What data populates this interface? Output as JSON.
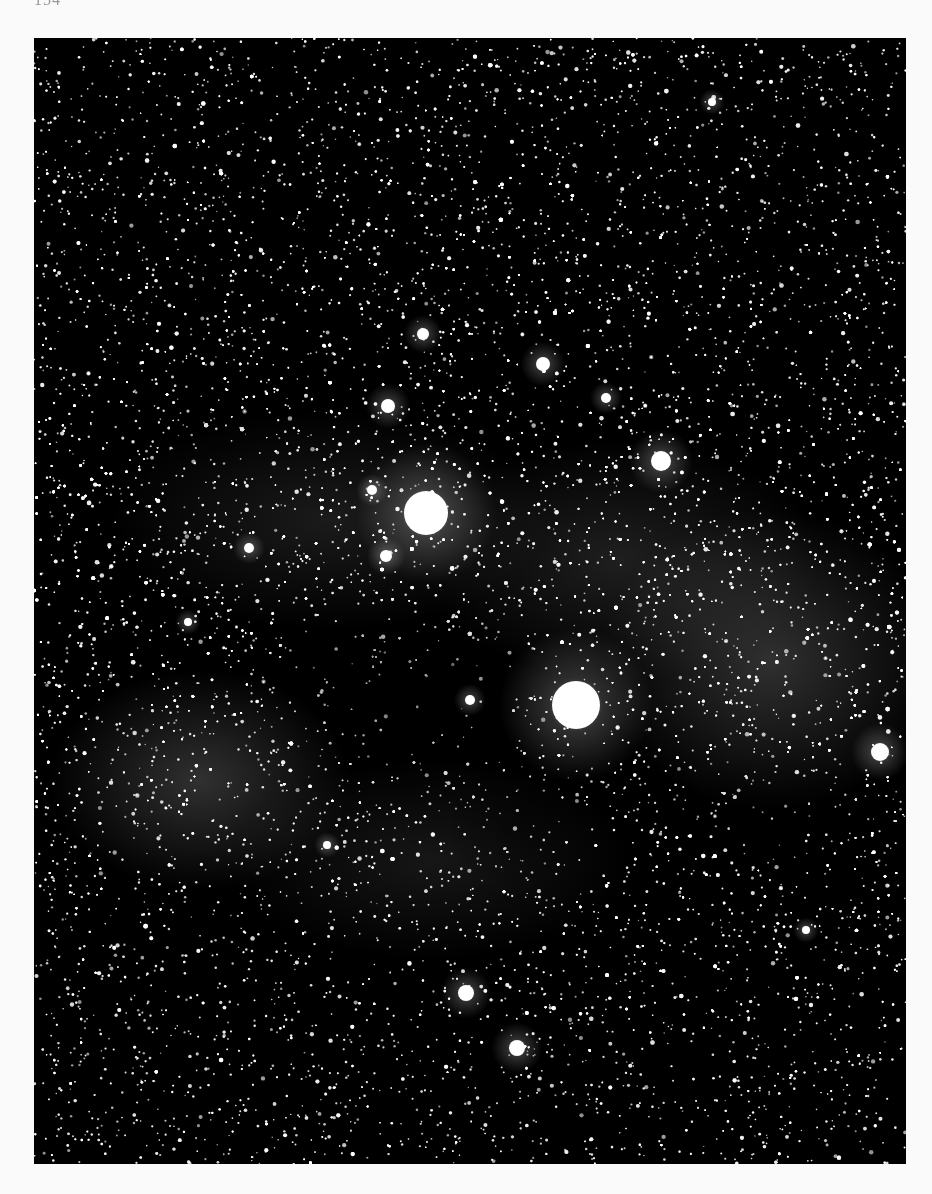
{
  "page": {
    "number": "154",
    "background": "#fafafa"
  },
  "photo": {
    "subject": "Milky Way star field with dark nebula",
    "frame": {
      "left": 34,
      "top": 38,
      "width": 872,
      "height": 1126
    },
    "colors": {
      "sky": "#000000",
      "star": "#ffffff",
      "glow": "#d8d8d8"
    },
    "bright_stars": [
      {
        "x": 426,
        "y": 513,
        "r": 22,
        "label": "bright-star-upper"
      },
      {
        "x": 576,
        "y": 705,
        "r": 24,
        "label": "bright-star-lower"
      },
      {
        "x": 661,
        "y": 461,
        "r": 10
      },
      {
        "x": 543,
        "y": 364,
        "r": 7
      },
      {
        "x": 388,
        "y": 406,
        "r": 7
      },
      {
        "x": 466,
        "y": 993,
        "r": 8
      },
      {
        "x": 517,
        "y": 1048,
        "r": 8
      },
      {
        "x": 423,
        "y": 334,
        "r": 6
      },
      {
        "x": 606,
        "y": 398,
        "r": 5
      },
      {
        "x": 372,
        "y": 490,
        "r": 5
      },
      {
        "x": 386,
        "y": 556,
        "r": 6
      },
      {
        "x": 249,
        "y": 548,
        "r": 5
      },
      {
        "x": 470,
        "y": 700,
        "r": 5
      },
      {
        "x": 712,
        "y": 102,
        "r": 4
      },
      {
        "x": 806,
        "y": 930,
        "r": 4
      },
      {
        "x": 880,
        "y": 752,
        "r": 9
      },
      {
        "x": 188,
        "y": 622,
        "r": 4
      },
      {
        "x": 327,
        "y": 845,
        "r": 4
      }
    ],
    "milky_way_glows": [
      {
        "x": 200,
        "y": 780,
        "rx": 150,
        "ry": 110,
        "alpha": 0.22
      },
      {
        "x": 770,
        "y": 660,
        "rx": 170,
        "ry": 150,
        "alpha": 0.22
      },
      {
        "x": 620,
        "y": 560,
        "rx": 200,
        "ry": 120,
        "alpha": 0.14
      },
      {
        "x": 330,
        "y": 520,
        "rx": 220,
        "ry": 110,
        "alpha": 0.12
      },
      {
        "x": 430,
        "y": 860,
        "rx": 200,
        "ry": 100,
        "alpha": 0.1
      }
    ],
    "dark_nebulae": [
      {
        "x": 420,
        "y": 700,
        "rx": 150,
        "ry": 120,
        "alpha": 0.75
      },
      {
        "x": 330,
        "y": 660,
        "rx": 90,
        "ry": 70,
        "alpha": 0.55
      },
      {
        "x": 520,
        "y": 820,
        "rx": 80,
        "ry": 70,
        "alpha": 0.55
      },
      {
        "x": 200,
        "y": 440,
        "rx": 140,
        "ry": 40,
        "alpha": 0.35
      },
      {
        "x": 780,
        "y": 800,
        "rx": 130,
        "ry": 50,
        "alpha": 0.45
      }
    ],
    "star_density": {
      "field_stars": 9000,
      "band_stars": 9000
    }
  }
}
